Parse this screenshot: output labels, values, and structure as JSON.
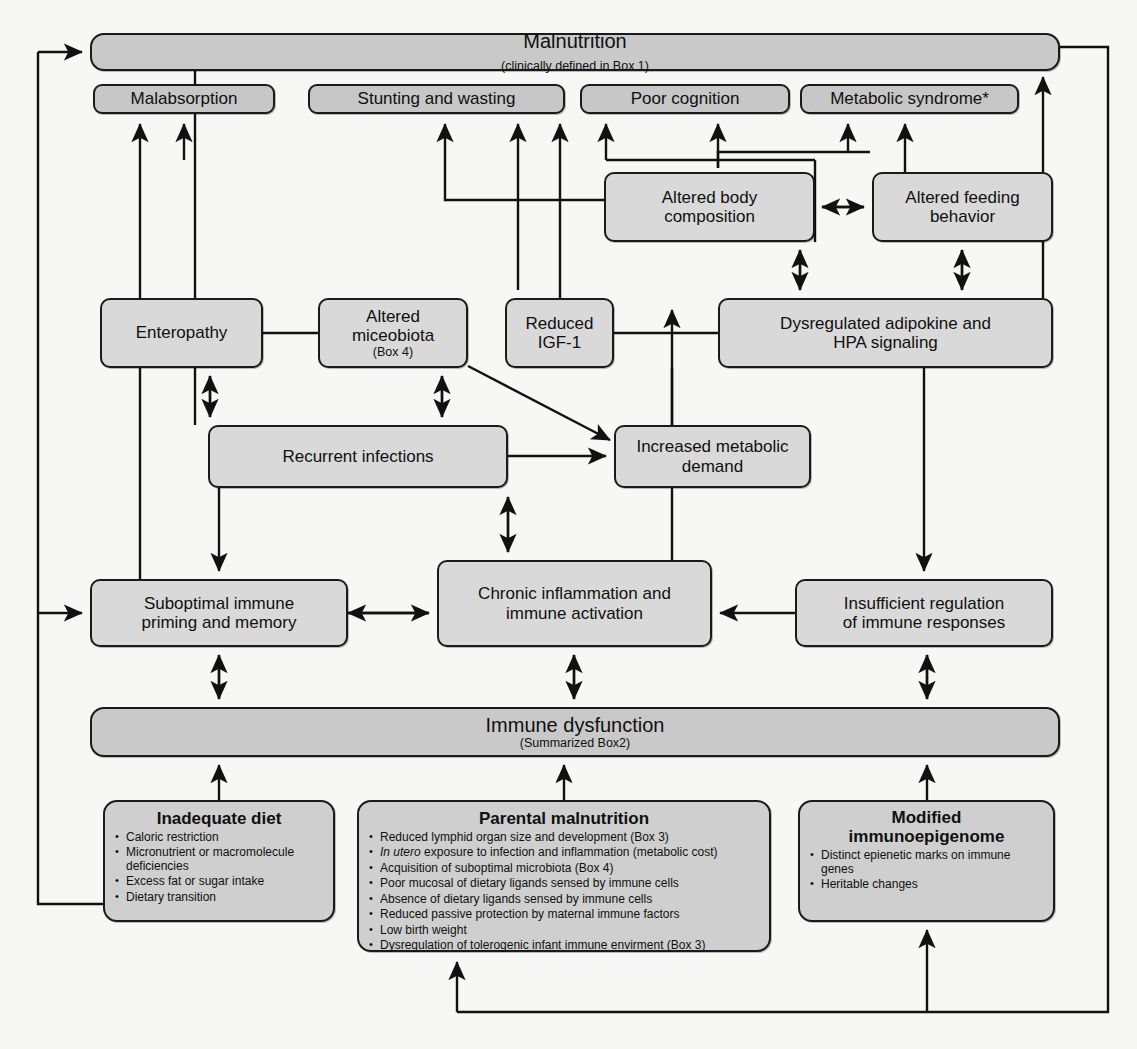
{
  "diagram": {
    "colors": {
      "box_fill": "#d4d4d4",
      "bar_fill": "#c9c9c9",
      "stroke": "#1a1a1a",
      "page": "#f7f7f5"
    }
  },
  "nodes": {
    "malnutrition": {
      "label": "Malnutrition",
      "note": "(clinically defined in Box 1)"
    },
    "malabsorption": {
      "label": "Malabsorption"
    },
    "stunting": {
      "label": "Stunting and wasting"
    },
    "cognition": {
      "label": "Poor cognition"
    },
    "metabolic_syndrome": {
      "label": "Metabolic syndrome*"
    },
    "altered_body_composition": {
      "line1": "Altered body",
      "line2": "composition"
    },
    "altered_feeding_behavior": {
      "line1": "Altered feeding",
      "line2": "behavior"
    },
    "enteropathy": {
      "label": "Enteropathy"
    },
    "altered_microbiota": {
      "line1": "Altered",
      "line2": "miceobiota",
      "note": "(Box 4)"
    },
    "reduced_igf1": {
      "line1": "Reduced",
      "line2": "IGF-1"
    },
    "dysregulated_adipokine": {
      "line1": "Dysregulated adipokine and",
      "line2": "HPA signaling"
    },
    "recurrent_infections": {
      "label": "Recurrent infections"
    },
    "increased_metabolic_demand": {
      "line1": "Increased metabolic",
      "line2": "demand"
    },
    "suboptimal_immune": {
      "line1": "Suboptimal immune",
      "line2": "priming and memory"
    },
    "chronic_inflammation": {
      "line1": "Chronic inflammation and",
      "line2": "immune activation"
    },
    "insufficient_regulation": {
      "line1": "Insufficient regulation",
      "line2": "of immune responses"
    },
    "immune_dysfunction": {
      "label": "Immune dysfunction",
      "note": "(Summarized Box2)"
    },
    "inadequate_diet": {
      "title": "Inadequate diet",
      "bullets": [
        "Caloric restriction",
        "Micronutrient or macromolecule deficiencies",
        "Excess fat or sugar intake",
        "Dietary transition"
      ]
    },
    "parental_malnutrition": {
      "title": "Parental malnutrition",
      "bullets": [
        "Reduced lymphid organ size and development (Box 3)",
        "In utero exposure to infection and inflammation (metabolic cost)",
        "Acquisition of suboptimal microbiota (Box 4)",
        "Poor mucosal of dietary ligands sensed by immune cells",
        "Absence of dietary ligands sensed by immune cells",
        "Reduced passive protection by maternal immune factors",
        "Low birth weight",
        "Dysregulation of tolerogenic infant immune envirment (Box 3)"
      ],
      "italic_prefix": "In utero"
    },
    "modified_immunoepigenome": {
      "title_line1": "Modified",
      "title_line2": "immunoepigenome",
      "bullets": [
        "Distinct epienetic marks on immune genes",
        "Heritable changes"
      ]
    }
  },
  "edges": [
    {
      "from": "inadequate_diet",
      "to": "malnutrition",
      "style": "single"
    },
    {
      "from": "inadequate_diet",
      "to": "suboptimal_immune",
      "style": "single"
    },
    {
      "from": "malnutrition",
      "to": "malabsorption",
      "style": "single"
    },
    {
      "from": "malnutrition",
      "to": "stunting",
      "style": "single"
    },
    {
      "from": "malnutrition",
      "to": "enteropathy",
      "style": "plain"
    },
    {
      "from": "metabolic_syndrome_feedback",
      "to": "malnutrition",
      "style": "single"
    },
    {
      "from": "altered_body_composition",
      "to": "cognition",
      "style": "single"
    },
    {
      "from": "altered_body_composition",
      "to": "metabolic_syndrome",
      "style": "single"
    },
    {
      "from": "altered_body_composition",
      "to": "altered_feeding_behavior",
      "style": "double"
    },
    {
      "from": "dysregulated_adipokine",
      "to": "altered_body_composition",
      "style": "double"
    },
    {
      "from": "dysregulated_adipokine",
      "to": "altered_feeding_behavior",
      "style": "double"
    },
    {
      "from": "dysregulated_adipokine",
      "to": "insufficient_regulation",
      "style": "single"
    },
    {
      "from": "enteropathy",
      "to": "malabsorption",
      "style": "single"
    },
    {
      "from": "enteropathy",
      "to": "recurrent_infections",
      "style": "double"
    },
    {
      "from": "altered_microbiota",
      "to": "recurrent_infections",
      "style": "double"
    },
    {
      "from": "altered_microbiota",
      "to": "increased_metabolic_demand",
      "style": "single"
    },
    {
      "from": "reduced_igf1",
      "to": "stunting",
      "style": "single"
    },
    {
      "from": "recurrent_infections",
      "to": "increased_metabolic_demand",
      "style": "single"
    },
    {
      "from": "recurrent_infections",
      "to": "chronic_inflammation",
      "style": "double"
    },
    {
      "from": "recurrent_infections",
      "to": "suboptimal_immune",
      "style": "single"
    },
    {
      "from": "increased_metabolic_demand",
      "to": "reduced_igf1",
      "style": "single"
    },
    {
      "from": "suboptimal_immune",
      "to": "chronic_inflammation",
      "style": "double"
    },
    {
      "from": "insufficient_regulation",
      "to": "chronic_inflammation",
      "style": "single"
    },
    {
      "from": "immune_dysfunction",
      "to": "suboptimal_immune",
      "style": "double"
    },
    {
      "from": "immune_dysfunction",
      "to": "chronic_inflammation",
      "style": "double"
    },
    {
      "from": "immune_dysfunction",
      "to": "insufficient_regulation",
      "style": "double"
    },
    {
      "from": "parental_malnutrition",
      "to": "immune_dysfunction",
      "style": "single"
    },
    {
      "from": "modified_immunoepigenome",
      "to": "immune_dysfunction",
      "style": "single"
    },
    {
      "from": "malnutrition_right_loop",
      "to": "parental_malnutrition",
      "style": "single"
    },
    {
      "from": "malnutrition_right_loop",
      "to": "modified_immunoepigenome",
      "style": "single"
    }
  ]
}
